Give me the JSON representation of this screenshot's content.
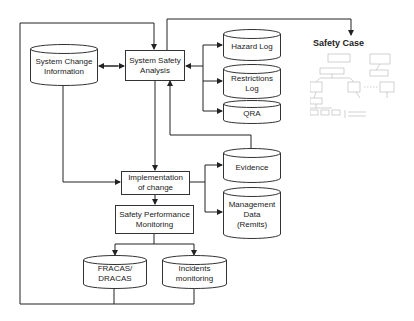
{
  "diagram": {
    "nodes": {
      "system_change_information": {
        "label": "System Change\nInformation",
        "shape": "cylinder"
      },
      "system_safety_analysis": {
        "label": "System Safety\nAnalysis",
        "shape": "box"
      },
      "hazard_log": {
        "label": "Hazard Log",
        "shape": "cylinder"
      },
      "restrictions_log": {
        "label": "Restrictions\nLog",
        "shape": "cylinder"
      },
      "qra": {
        "label": "QRA",
        "shape": "cylinder"
      },
      "safety_case": {
        "label": "Safety Case",
        "shape": "image-thumbnail"
      },
      "implementation_of_change": {
        "label": "Implementation\nof change",
        "shape": "box"
      },
      "evidence": {
        "label": "Evidence",
        "shape": "cylinder"
      },
      "management_data": {
        "label": "Management\nData\n(Remits)",
        "shape": "cylinder"
      },
      "safety_performance_monitoring": {
        "label": "Safety Performance\nMonitoring",
        "shape": "box"
      },
      "fracas_dracas": {
        "label": "FRACAS/\nDRACAS",
        "shape": "cylinder"
      },
      "incidents_monitoring": {
        "label": "Incidents\nmonitoring",
        "shape": "cylinder"
      }
    },
    "edges": [
      {
        "from": "system_change_information",
        "to": "system_safety_analysis",
        "bidirectional": true
      },
      {
        "from": "system_safety_analysis",
        "to": "hazard_log"
      },
      {
        "from": "system_safety_analysis",
        "to": "restrictions_log"
      },
      {
        "from": "system_safety_analysis",
        "to": "qra"
      },
      {
        "from": "hazard_log",
        "to": "system_safety_analysis"
      },
      {
        "from": "system_safety_analysis",
        "to": "safety_case"
      },
      {
        "from": "system_safety_analysis",
        "to": "implementation_of_change"
      },
      {
        "from": "system_change_information",
        "to": "implementation_of_change"
      },
      {
        "from": "implementation_of_change",
        "to": "evidence"
      },
      {
        "from": "implementation_of_change",
        "to": "management_data"
      },
      {
        "from": "evidence",
        "to": "system_safety_analysis"
      },
      {
        "from": "implementation_of_change",
        "to": "safety_performance_monitoring"
      },
      {
        "from": "safety_performance_monitoring",
        "to": "fracas_dracas"
      },
      {
        "from": "safety_performance_monitoring",
        "to": "incidents_monitoring"
      },
      {
        "from": "fracas_dracas",
        "to": "system_safety_analysis"
      },
      {
        "from": "incidents_monitoring",
        "to": "system_safety_analysis"
      }
    ],
    "colors": {
      "line": "#222222",
      "thumbnail": "#b8b8b8"
    }
  }
}
